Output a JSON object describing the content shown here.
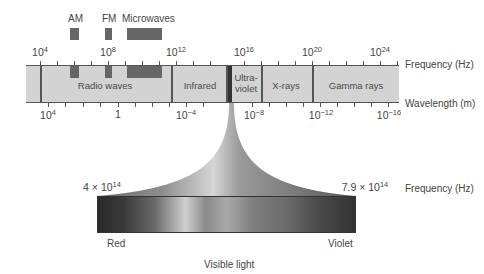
{
  "diagram": {
    "sub_bands": [
      {
        "label": "AM",
        "x": 70,
        "width": 9
      },
      {
        "label": "FM",
        "x": 105,
        "width": 7
      },
      {
        "label": "Microwaves",
        "x": 127,
        "width": 35
      }
    ],
    "frequency_axis": {
      "title": "Frequency (Hz)",
      "ticks": [
        {
          "base": "10",
          "exp": "4",
          "x": 40
        },
        {
          "base": "10",
          "exp": "8",
          "x": 108
        },
        {
          "base": "10",
          "exp": "12",
          "x": 176
        },
        {
          "base": "10",
          "exp": "16",
          "x": 244
        },
        {
          "base": "10",
          "exp": "20",
          "x": 312
        },
        {
          "base": "10",
          "exp": "24",
          "x": 380
        }
      ]
    },
    "wavelength_axis": {
      "title": "Wavelength (m)",
      "ticks": [
        {
          "base": "10",
          "exp": "4",
          "x": 48
        },
        {
          "base": "1",
          "exp": "",
          "x": 118
        },
        {
          "base": "10",
          "exp": "−4",
          "x": 184
        },
        {
          "base": "10",
          "exp": "−8",
          "x": 252
        },
        {
          "base": "10",
          "exp": "−12",
          "x": 318
        },
        {
          "base": "10",
          "exp": "−16",
          "x": 386
        }
      ]
    },
    "bands": [
      {
        "label": "Radio waves",
        "center_x": 105
      },
      {
        "label": "Infrared",
        "center_x": 200
      },
      {
        "label": "Ultra-",
        "label2": "violet",
        "center_x": 246
      },
      {
        "label": "X-rays",
        "center_x": 285
      },
      {
        "label": "Gamma rays",
        "center_x": 355
      }
    ],
    "visible_light": {
      "title": "Visible light",
      "freq_low": "4 × 10",
      "freq_low_exp": "14",
      "freq_high": "7.9 × 10",
      "freq_high_exp": "14",
      "freq_unit": "Frequency (Hz)",
      "left_color_label": "Red",
      "right_color_label": "Violet"
    }
  }
}
